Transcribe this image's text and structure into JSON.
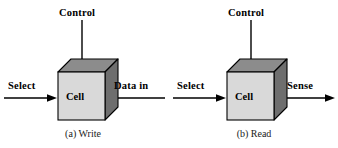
{
  "figure": {
    "background_color": "#ffffff",
    "stroke_color": "#000000",
    "cube_front_color": "#d9d9d9",
    "cube_top_color": "#8c8c8c",
    "cube_side_color": "#6e6e6e"
  },
  "panels": [
    {
      "id": "write",
      "caption": "(a) Write",
      "cell_label": "Cell",
      "ports": {
        "control": {
          "label": "Control",
          "direction": "in",
          "orientation": "vertical"
        },
        "select": {
          "label": "Select",
          "direction": "in",
          "orientation": "horizontal"
        },
        "data": {
          "label": "Data in",
          "direction": "in",
          "orientation": "horizontal"
        }
      }
    },
    {
      "id": "read",
      "caption": "(b) Read",
      "cell_label": "Cell",
      "ports": {
        "control": {
          "label": "Control",
          "direction": "in",
          "orientation": "vertical"
        },
        "select": {
          "label": "Select",
          "direction": "in",
          "orientation": "horizontal"
        },
        "data": {
          "label": "Sense",
          "direction": "out",
          "orientation": "horizontal"
        }
      }
    }
  ]
}
